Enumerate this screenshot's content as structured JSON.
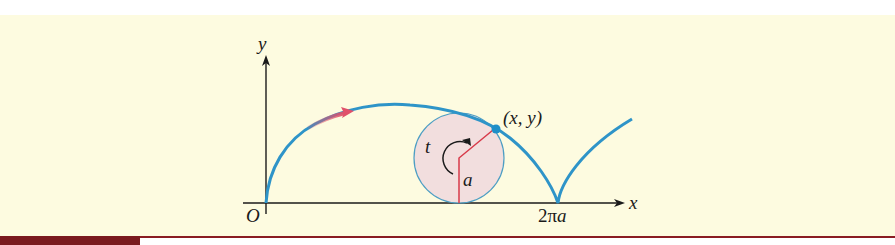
{
  "figure": {
    "labels": {
      "y_axis": "y",
      "x_axis": "x",
      "origin": "O",
      "point": "(x, y)",
      "angle": "t",
      "radius": "a",
      "period_prefix": "2π",
      "period_suffix": "a"
    },
    "colors": {
      "background": "#fdfbe0",
      "curve": "#2e94c8",
      "arrow": "#e0506a",
      "circle_fill": "#f2dede",
      "circle_stroke": "#4d9ec4",
      "radius_line": "#d83a4a",
      "axis": "#1a1a1a",
      "footer_bar": "#7a1a1e"
    }
  }
}
